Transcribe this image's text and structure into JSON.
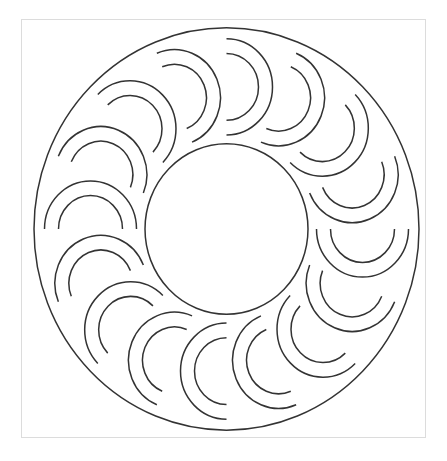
{
  "pattern": {
    "title": "",
    "colors": {
      "background": "#ffffff",
      "line": "#333333",
      "frame": "#dcdcdc"
    },
    "frame": {
      "x": 21.5,
      "y": 19.5,
      "width": 404,
      "height": 418
    },
    "center": {
      "x": 226.5,
      "y": 229
    },
    "vertical_stretch": 1.045,
    "outer_circle": {
      "r": 192.5
    },
    "inner_circle": {
      "r": 81.5
    },
    "motifs": {
      "count": 16,
      "ring_radius": 136,
      "start_angle_deg": -90,
      "outer_arc_radius": 46,
      "inner_arc_radius": 32,
      "shape": "double-crescent",
      "orientation": "semicircle bulging clockwise-tangential"
    }
  }
}
